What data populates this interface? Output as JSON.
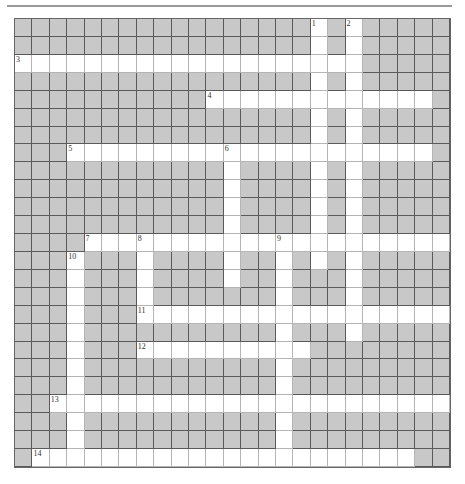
{
  "puzzle": {
    "rows": 25,
    "cols": 25,
    "colors": {
      "block": "#c8c8c8",
      "open": "#ffffff",
      "line": "#5a5a5a"
    },
    "entries": [
      {
        "number": "1",
        "direction": "down",
        "row": 0,
        "col": 17,
        "length": 14
      },
      {
        "number": "2",
        "direction": "down",
        "row": 0,
        "col": 19,
        "length": 18
      },
      {
        "number": "3",
        "direction": "across",
        "row": 2,
        "col": 0,
        "length": 20
      },
      {
        "number": "4",
        "direction": "across",
        "row": 4,
        "col": 11,
        "length": 13
      },
      {
        "number": "5",
        "direction": "across",
        "row": 7,
        "col": 3,
        "length": 21
      },
      {
        "number": "6",
        "direction": "down",
        "row": 7,
        "col": 12,
        "length": 8
      },
      {
        "number": "7",
        "direction": "across",
        "row": 12,
        "col": 4,
        "length": 21
      },
      {
        "number": "8",
        "direction": "down",
        "row": 12,
        "col": 7,
        "length": 5
      },
      {
        "number": "9",
        "direction": "down",
        "row": 12,
        "col": 15,
        "length": 13
      },
      {
        "number": "10",
        "direction": "down",
        "row": 13,
        "col": 3,
        "length": 12
      },
      {
        "number": "11",
        "direction": "across",
        "row": 16,
        "col": 7,
        "length": 18
      },
      {
        "number": "12",
        "direction": "across",
        "row": 18,
        "col": 7,
        "length": 10
      },
      {
        "number": "13",
        "direction": "across",
        "row": 21,
        "col": 2,
        "length": 23
      },
      {
        "number": "14",
        "direction": "across",
        "row": 24,
        "col": 1,
        "length": 22
      }
    ]
  }
}
